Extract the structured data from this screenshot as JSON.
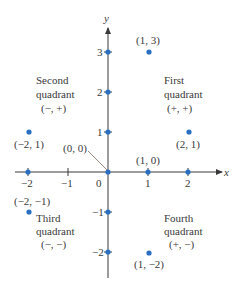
{
  "colors": {
    "axis": "#3a3a3a",
    "point": "#2a6fc2",
    "leader": "#8a6a5a",
    "text": "#3a3a3a"
  },
  "axes": {
    "x_name": "x",
    "y_name": "y",
    "x_ticks": [
      "−2",
      "−1",
      "0",
      "1",
      "2"
    ],
    "y_ticks": [
      "3",
      "2",
      "1",
      "−1",
      "−2"
    ]
  },
  "quadrants": {
    "first": {
      "line1": "First",
      "line2": "quadrant",
      "signs": "(+, +)"
    },
    "second": {
      "line1": "Second",
      "line2": "quadrant",
      "signs": "(−, +)"
    },
    "third": {
      "line1": "Third",
      "line2": "quadrant",
      "signs": "(−, −)"
    },
    "fourth": {
      "line1": "Fourth",
      "line2": "quadrant",
      "signs": "(+, −)"
    }
  },
  "points": {
    "p_1_3": "(1, 3)",
    "p_m2_1": "(−2, 1)",
    "p_2_1": "(2, 1)",
    "p_0_0": "(0, 0)",
    "p_1_0": "(1, 0)",
    "p_m2_m1": "(−2, −1)",
    "p_1_m2": "(1, −2)"
  }
}
